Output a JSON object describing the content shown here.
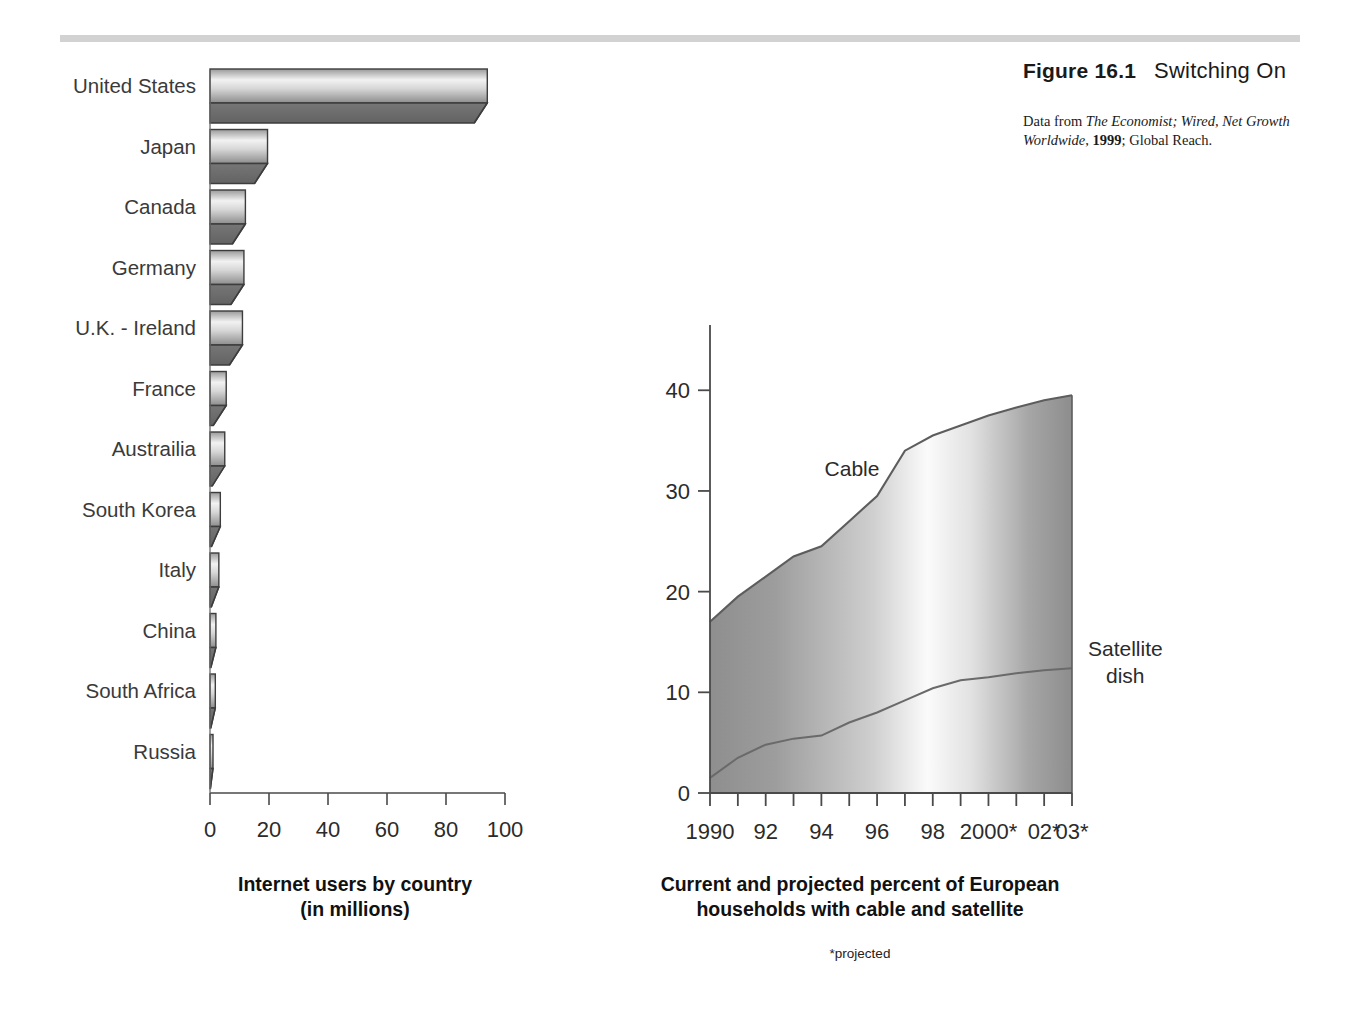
{
  "figure": {
    "number": "Figure 16.1",
    "title": "Switching On",
    "source_prefix": "Data from ",
    "source_italic1": "The Economist; Wired, Net Growth Worldwide",
    "source_mid": ", ",
    "source_year": "1999",
    "source_tail": "; Global Reach."
  },
  "top_rule_color": "#d2d2d2",
  "captions": {
    "bar_line1": "Internet users by country",
    "bar_line2": "(in millions)",
    "area_line1": "Current and projected percent of European",
    "area_line2": "households with cable and satellite",
    "note": "*projected"
  },
  "chart_data": [
    {
      "type": "bar",
      "orientation": "horizontal",
      "title": "Internet users by country (in millions)",
      "xlabel": "",
      "ylabel": "",
      "xlim": [
        0,
        100
      ],
      "xticks": [
        0,
        20,
        40,
        60,
        80,
        100
      ],
      "xticklabels": [
        "0",
        "20",
        "40",
        "60",
        "80",
        "100"
      ],
      "grid": false,
      "categories": [
        "United States",
        "Japan",
        "Canada",
        "Germany",
        "U.K. - Ireland",
        "France",
        "Austrailia",
        "South Korea",
        "Italy",
        "China",
        "South Africa",
        "Russia"
      ],
      "values": [
        94,
        19.5,
        12,
        11.5,
        11,
        5.5,
        5,
        3.5,
        3,
        2,
        1.8,
        1
      ],
      "bar_style": "3d-beveled-gradient",
      "bar_face_light": "#ffffff",
      "bar_face_dark": "#8a8a8a",
      "bar_side_color": "#6e6e6e",
      "bar_outline": "#3a3a3a"
    },
    {
      "type": "area",
      "stacked": false,
      "title": "Current and projected percent of European households with cable and satellite",
      "xlabel": "",
      "ylabel": "",
      "ylim": [
        0,
        44
      ],
      "yticks": [
        0,
        10,
        20,
        30,
        40
      ],
      "yticklabels": [
        "0",
        "10",
        "20",
        "30",
        "40"
      ],
      "xticklabels": [
        "1990",
        "92",
        "94",
        "96",
        "98",
        "2000*",
        "02*",
        "03*"
      ],
      "x": [
        1990,
        1991,
        1992,
        1993,
        1994,
        1995,
        1996,
        1997,
        1998,
        1999,
        2000,
        2001,
        2002,
        2003
      ],
      "grid": false,
      "legend_position": "inline-annotation",
      "series": [
        {
          "name": "Cable",
          "values": [
            17,
            19.5,
            21.5,
            23.5,
            24.5,
            27,
            29.5,
            34,
            35.5,
            36.5,
            37.5,
            38.3,
            39,
            39.5
          ]
        },
        {
          "name": "Satellite dish",
          "values": [
            1.5,
            3.5,
            4.8,
            5.4,
            5.7,
            7,
            8,
            9.2,
            10.4,
            11.2,
            11.5,
            11.9,
            12.2,
            12.4
          ]
        }
      ],
      "annotations": [
        {
          "label": "Cable",
          "x": 1995.1,
          "y": 31.5
        },
        {
          "label": "Satellite dish",
          "x": 2003.4,
          "y": 13.6
        }
      ]
    }
  ]
}
